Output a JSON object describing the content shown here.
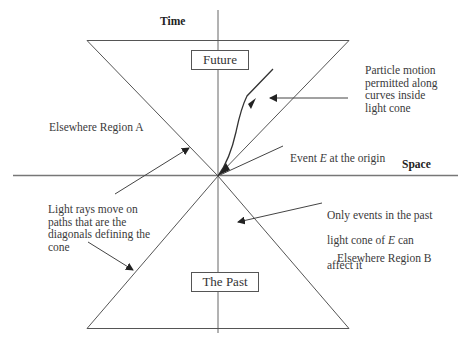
{
  "diagram": {
    "type": "spacetime-light-cone",
    "axes": {
      "time_label": "Time",
      "space_label": "Space"
    },
    "regions": {
      "future_label": "Future",
      "past_label": "The Past",
      "elsewhere_a": "Elsewhere Region A",
      "elsewhere_b": "Elsewhere Region B"
    },
    "annotations": {
      "particle_motion": "Particle motion\npermitted along\ncurves inside\nlight cone",
      "event_origin_prefix": "Event ",
      "event_origin_symbol": "E",
      "event_origin_suffix": " at the origin",
      "light_rays": "Light rays move on\npaths that are the\ndiagonals defining the\ncone",
      "past_events_line1": "Only events in the past",
      "past_events_line2_prefix": "light cone of ",
      "past_events_symbol": "E",
      "past_events_line2_suffix": " can",
      "past_events_line3": "affect it"
    },
    "colors": {
      "line": "#555555",
      "text": "#333333",
      "background": "#ffffff"
    }
  }
}
